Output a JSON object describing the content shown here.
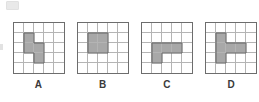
{
  "figure": {
    "grid_rows": 5,
    "grid_columns": 5,
    "shaded_color": "#a8a8a8",
    "grid_line_color": "#b4b4b4",
    "border_color": "#6d6d6d",
    "background_color": "#ffffff",
    "outline_color": "#6f6f6f"
  },
  "options": [
    {
      "label": "A",
      "shape_name": "s-tetromino",
      "shaded_cells": [
        [
          1,
          1
        ],
        [
          2,
          1
        ],
        [
          2,
          2
        ],
        [
          3,
          2
        ]
      ],
      "shaded_count": 4
    },
    {
      "label": "B",
      "shape_name": "square-tetromino",
      "shaded_cells": [
        [
          1,
          1
        ],
        [
          1,
          2
        ],
        [
          2,
          1
        ],
        [
          2,
          2
        ]
      ],
      "shaded_count": 4
    },
    {
      "label": "C",
      "shape_name": "j-pentomino",
      "shaded_cells": [
        [
          2,
          1
        ],
        [
          2,
          2
        ],
        [
          2,
          3
        ],
        [
          3,
          1
        ]
      ],
      "shaded_count": 4
    },
    {
      "label": "D",
      "shape_name": "t-pentomino",
      "shaded_cells": [
        [
          1,
          1
        ],
        [
          2,
          1
        ],
        [
          2,
          2
        ],
        [
          2,
          3
        ],
        [
          3,
          1
        ]
      ],
      "shaded_count": 5
    }
  ]
}
